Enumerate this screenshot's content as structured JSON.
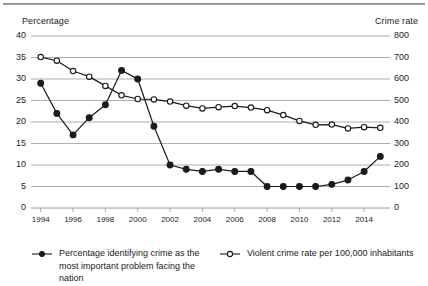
{
  "chart_data": {
    "type": "line",
    "title": "",
    "xlabel": "",
    "ylabel": "Percentage",
    "y2label": "Crime rate",
    "x": [
      1994,
      1995,
      1996,
      1997,
      1998,
      1999,
      2000,
      2001,
      2002,
      2003,
      2004,
      2005,
      2006,
      2007,
      2008,
      2009,
      2010,
      2011,
      2012,
      2013,
      2014,
      2015
    ],
    "xlim": [
      1993.4,
      2015.6
    ],
    "ylim": [
      0,
      40
    ],
    "y2lim": [
      0,
      800
    ],
    "grid": true,
    "legend_position": "bottom",
    "xticks": [
      "1994",
      "1996",
      "1998",
      "2000",
      "2002",
      "2004",
      "2006",
      "2008",
      "2010",
      "2012",
      "2014"
    ],
    "xtick_values": [
      1994,
      1996,
      1998,
      2000,
      2002,
      2004,
      2006,
      2008,
      2010,
      2012,
      2014
    ],
    "yticks_left": [
      "0",
      "5",
      "10",
      "15",
      "20",
      "25",
      "30",
      "35",
      "40"
    ],
    "ytick_left_values": [
      0,
      5,
      10,
      15,
      20,
      25,
      30,
      35,
      40
    ],
    "yticks_right": [
      "0",
      "100",
      "200",
      "300",
      "400",
      "500",
      "600",
      "700",
      "800"
    ],
    "ytick_right_values": [
      0,
      100,
      200,
      300,
      400,
      500,
      600,
      700,
      800
    ],
    "series": [
      {
        "name": "Percentage identifying crime as the most important problem facing the nation",
        "axis": "left",
        "marker": "filled-circle",
        "color": "#1a1a1a",
        "values": [
          29,
          22,
          17,
          21,
          24,
          32,
          30,
          19,
          10,
          9,
          8.5,
          9,
          8.5,
          8.5,
          5,
          5,
          5,
          5,
          5.5,
          6.5,
          8.5,
          12
        ]
      },
      {
        "name": "Violent crime rate per 100,000 inhabitants",
        "axis": "right",
        "marker": "open-circle",
        "color": "#1a1a1a",
        "values": [
          702,
          685,
          637,
          611,
          568,
          524,
          507,
          505,
          495,
          476,
          463,
          469,
          474,
          467,
          455,
          432,
          405,
          387,
          388,
          370,
          376,
          373
        ]
      }
    ]
  },
  "legend": {
    "entries": [
      {
        "label": "Percentage identifying crime as the most important problem facing the nation",
        "marker": "filled-circle"
      },
      {
        "label": "Violent crime rate per 100,000 inhabitants",
        "marker": "open-circle"
      }
    ]
  }
}
